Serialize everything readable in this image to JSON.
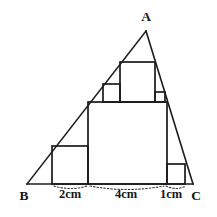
{
  "figure": {
    "background_color": "#ffffff",
    "line_color": "#1b1b1b",
    "dotted_color": "#3a3a3a",
    "vertices": {
      "a": {
        "label": "A",
        "x": 146,
        "y": 31,
        "label_x": 146,
        "label_y": 21
      },
      "b": {
        "label": "B",
        "x": 27,
        "y": 184,
        "label_x": 24,
        "label_y": 200
      },
      "c": {
        "label": "C",
        "x": 193,
        "y": 184,
        "label_x": 196,
        "label_y": 200
      }
    },
    "dimensions": [
      {
        "name": "segment-2cm",
        "label": "2cm",
        "label_x": 70,
        "label_y": 198,
        "arc_start_x": 54,
        "arc_end_x": 87,
        "arc_y": 186,
        "arc_dip": 5
      },
      {
        "name": "segment-4cm",
        "label": "4cm",
        "label_x": 126,
        "label_y": 198,
        "arc_start_x": 90,
        "arc_end_x": 164,
        "arc_y": 186,
        "arc_dip": 7
      },
      {
        "name": "segment-1cm",
        "label": "1cm",
        "label_x": 171,
        "label_y": 198,
        "arc_start_x": 166,
        "arc_end_x": 186,
        "arc_y": 186,
        "arc_dip": 5
      }
    ],
    "squares": [
      {
        "name": "square-left-lower",
        "x": 52,
        "y": 146,
        "w": 36,
        "h": 38
      },
      {
        "name": "square-center-large",
        "x": 88,
        "y": 102,
        "w": 79,
        "h": 82
      },
      {
        "name": "square-right-lower",
        "x": 167,
        "y": 164,
        "w": 18,
        "h": 20
      },
      {
        "name": "square-upper-left",
        "x": 103,
        "y": 84,
        "w": 17,
        "h": 18
      },
      {
        "name": "square-upper-center",
        "x": 120,
        "y": 62,
        "w": 35,
        "h": 40
      },
      {
        "name": "square-upper-right",
        "x": 155,
        "y": 92,
        "w": 10,
        "h": 10
      }
    ],
    "triangle_sides": [
      {
        "name": "side-ab",
        "x1": 146,
        "y1": 31,
        "x2": 27,
        "y2": 184
      },
      {
        "name": "side-ac",
        "x1": 146,
        "y1": 31,
        "x2": 193,
        "y2": 184
      },
      {
        "name": "side-bc",
        "x1": 27,
        "y1": 184,
        "x2": 193,
        "y2": 184
      }
    ]
  }
}
